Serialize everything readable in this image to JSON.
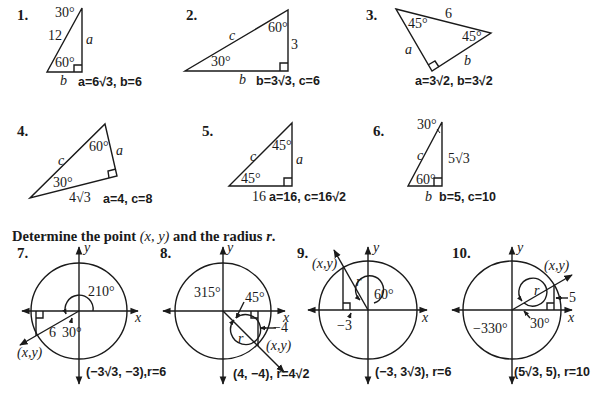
{
  "section1": {
    "problems": [
      {
        "number": "1.",
        "labels": {
          "top_angle": "30°",
          "hyp": "12",
          "side_a": "a",
          "bottom_angle": "60°",
          "side_b": "b"
        },
        "answer": "a=6√3, b=6"
      },
      {
        "number": "2.",
        "labels": {
          "hyp": "c",
          "top_angle": "60°",
          "side": "3",
          "bottom_angle": "30°",
          "side_b": "b"
        },
        "answer": "b=3√3, c=6"
      },
      {
        "number": "3.",
        "labels": {
          "left_angle": "45°",
          "hyp": "6",
          "right_angle": "45°",
          "side_a": "a",
          "side_b": "b"
        },
        "answer": "a=3√2, b=3√2"
      },
      {
        "number": "4.",
        "labels": {
          "hyp": "c",
          "top_angle": "60°",
          "side_a": "a",
          "bottom_angle": "30°",
          "base": "4√3"
        },
        "answer": "a=4, c=8"
      },
      {
        "number": "5.",
        "labels": {
          "hyp": "c",
          "top_angle": "45°",
          "side_a": "a",
          "bottom_angle": "45°",
          "base": "16"
        },
        "answer": "a=16, c=16√2"
      },
      {
        "number": "6.",
        "labels": {
          "top_angle": "30°",
          "hyp": "c",
          "side": "5√3",
          "bottom_angle": "60°",
          "side_b": "b"
        },
        "answer": "b=5, c=10"
      }
    ]
  },
  "section2": {
    "heading_parts": [
      "Determine the point ",
      "(x, y)",
      " and the radius ",
      "r",
      "."
    ],
    "problems": [
      {
        "number": "7.",
        "labels": {
          "y": "y",
          "x": "x",
          "angle": "210°",
          "ref_angle": "30°",
          "r": "6",
          "point": "(x,y)"
        },
        "answer": "(−3√3, −3),r=6"
      },
      {
        "number": "8.",
        "labels": {
          "y": "y",
          "x": "x",
          "angle": "315°",
          "ref_angle": "45°",
          "r": "r",
          "side": "−4",
          "point": "(x,y)"
        },
        "answer": "(4, −4), r=4√2"
      },
      {
        "number": "9.",
        "labels": {
          "y": "y",
          "x": "x",
          "angle": "60°",
          "r": "r",
          "side": "−3",
          "point": "(x,y)"
        },
        "answer": "(−3, 3√3), r=6"
      },
      {
        "number": "10.",
        "labels": {
          "y": "y",
          "x": "x",
          "angle": "−330°",
          "ref_angle": "30°",
          "r": "r",
          "side": "5",
          "point": "(x,y)"
        },
        "answer": "(5√3, 5), r=10"
      }
    ]
  }
}
